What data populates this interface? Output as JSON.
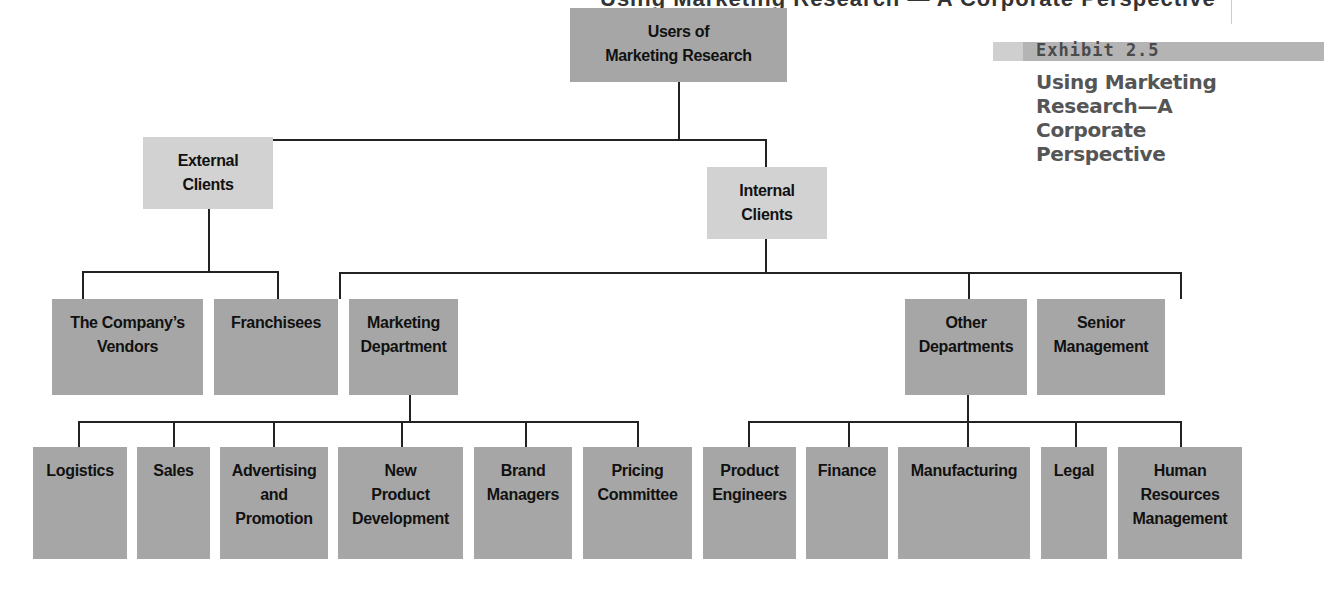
{
  "page": {
    "clipped_header": "Using Marketing Research — A Corporate Perspective"
  },
  "exhibit": {
    "label": "Exhibit 2.5",
    "title": "Using Marketing\nResearch—A\nCorporate\nPerspective"
  },
  "colors": {
    "primary_box": "#a6a6a6",
    "secondary_box": "#d2d2d2",
    "connector": "#222222",
    "exhibit_bar": "#b4b4b4",
    "exhibit_text": "#555555"
  },
  "org_chart": {
    "root": {
      "label": "Users of\nMarketing Research"
    },
    "external": {
      "label": "External\nClients",
      "children": [
        {
          "label": "The Company’s\nVendors"
        },
        {
          "label": "Franchisees"
        }
      ]
    },
    "internal": {
      "label": "Internal\nClients",
      "children": [
        {
          "label": "Marketing\nDepartment"
        },
        {
          "label": "Other\nDepartments"
        },
        {
          "label": "Senior\nManagement"
        }
      ]
    },
    "marketing_department": {
      "children": [
        {
          "label": "Logistics"
        },
        {
          "label": "Sales"
        },
        {
          "label": "Advertising\nand\nPromotion"
        },
        {
          "label": "New\nProduct\nDevelopment"
        },
        {
          "label": "Brand\nManagers"
        },
        {
          "label": "Pricing\nCommittee"
        }
      ]
    },
    "other_departments": {
      "children": [
        {
          "label": "Product\nEngineers"
        },
        {
          "label": "Finance"
        },
        {
          "label": "Manufacturing"
        },
        {
          "label": "Legal"
        },
        {
          "label": "Human\nResources\nManagement"
        }
      ]
    }
  }
}
